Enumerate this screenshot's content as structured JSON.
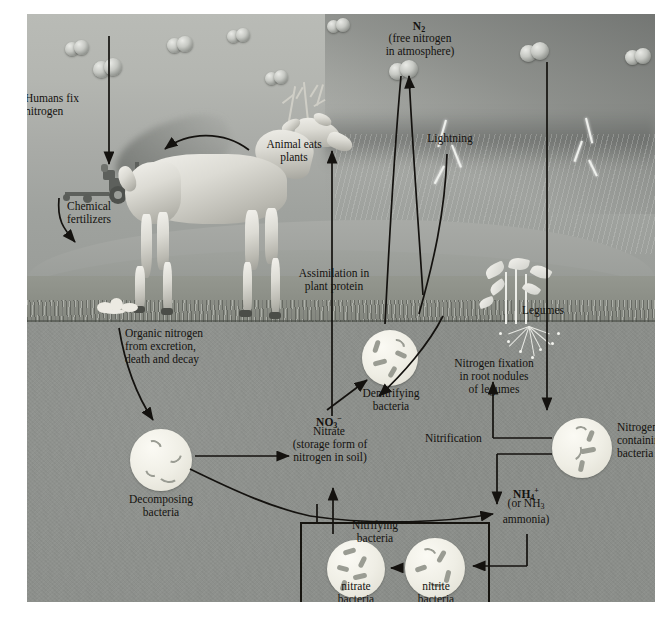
{
  "figure": {
    "labels": {
      "humans_fix_nitrogen": "Humans fix\nnitrogen",
      "chemical_fertilizers": "Chemical\nfertilizers",
      "animal_eats_plants": "Animal eats\nplants",
      "n2_symbol": "N2",
      "n2_caption": "(free nitrogen\nin atmosphere)",
      "lightning": "Lightning",
      "legumes": "Legumes",
      "assimilation": "Assimilation in\nplant protein",
      "organic_nitrogen": "Organic nitrogen\nfrom excretion,\ndeath and decay",
      "decomposing_bacteria": "Decomposing\nbacteria",
      "denitrifying_bacteria": "Denitrifying\nbacteria",
      "nitrate_pool_symbol": "NO3-",
      "nitrate_pool_name": "Nitrate",
      "nitrate_pool_caption": "(storage form of\nnitrogen in soil)",
      "nitrogen_fixation": "Nitrogen fixation\nin root nodules\nof legumes",
      "nitrification": "Nitrification",
      "nitrogenase_bacteria": "Nitrogenase-\ncontaining\nbacteria",
      "ammonium_symbol": "NH4+",
      "ammonium_caption": "(or NH3\nammonia)",
      "nitrifying_bacteria": "Nitrifying\nbacteria",
      "nitrate_bacteria": "nitrate\nbacteria",
      "nitrite_bacteria": "nitrite\nbacteria"
    },
    "colors": {
      "sky": "#b4b6b1",
      "storm": "#6e716e",
      "soil": "#8b8e8a",
      "ink": "#14120f",
      "bacteria_fill": "#efeee5",
      "bacteria_rod": "#9a9c93",
      "page_background": "#ffffff"
    }
  }
}
